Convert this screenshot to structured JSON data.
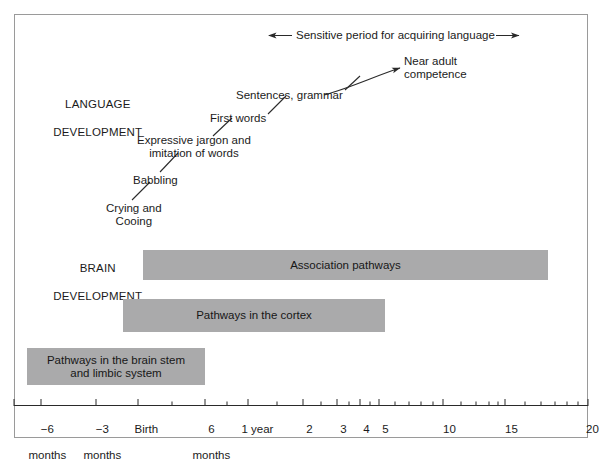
{
  "figure": {
    "sensitive_period": {
      "label": "Sensitive period for acquiring language",
      "left_arrow_icon": "left-arrow-icon",
      "right_arrow_icon": "right-arrow-icon"
    },
    "sections": {
      "language": {
        "heading_line1": "LANGUAGE",
        "heading_line2": "DEVELOPMENT"
      },
      "brain": {
        "heading_line1": "BRAIN",
        "heading_line2": "DEVELOPMENT"
      }
    },
    "language_milestones": [
      {
        "label": "Near adult\ncompetence"
      },
      {
        "label": "Sentences, grammar"
      },
      {
        "label": "First words"
      },
      {
        "label": "Expressive jargon and\nimitation of words"
      },
      {
        "label": "Babbling"
      },
      {
        "label": "Crying and\nCooing"
      }
    ],
    "brain_bars": [
      {
        "label": "Association pathways"
      },
      {
        "label": "Pathways in the cortex"
      },
      {
        "label": "Pathways in the brain stem\nand limbic system"
      }
    ],
    "axis": {
      "ticks": [
        {
          "line1": "−6",
          "line2": "months"
        },
        {
          "line1": "−3",
          "line2": "months"
        },
        {
          "line1": "Birth",
          "line2": ""
        },
        {
          "line1": "6",
          "line2": "months"
        },
        {
          "line1": "1 year",
          "line2": ""
        },
        {
          "line1": "2",
          "line2": ""
        },
        {
          "line1": "3",
          "line2": ""
        },
        {
          "line1": "4",
          "line2": ""
        },
        {
          "line1": "5",
          "line2": ""
        },
        {
          "line1": "10",
          "line2": ""
        },
        {
          "line1": "15",
          "line2": ""
        },
        {
          "line1": "20",
          "line2": ""
        }
      ]
    },
    "colors": {
      "bar_fill": "#aaaaab",
      "frame": "#9a9a9a",
      "text": "#1b1b1b"
    }
  },
  "chart_data": {
    "type": "bar",
    "title": "",
    "xlabel": "Age (log scale: months before birth through 20 years)",
    "ylabel": "",
    "grid": false,
    "legend": "none",
    "axis_scale": "log-after-birth",
    "axis_tick_values": [
      "-6 months",
      "-3 months",
      "Birth",
      "6 months",
      "1 year",
      "2",
      "3",
      "4",
      "5",
      "10",
      "15",
      "20"
    ],
    "axis_tick_pixels": [
      41,
      96,
      138,
      205,
      248,
      303,
      337,
      360,
      379,
      443,
      505,
      588
    ],
    "categories": [
      "Association pathways",
      "Pathways in the cortex",
      "Pathways in the brain stem and limbic system"
    ],
    "series": [
      {
        "name": "Brain development spans",
        "values": [
          {
            "category": "Association pathways",
            "start": "~3 months",
            "end": "~15 years",
            "start_px": 143,
            "end_px": 548
          },
          {
            "category": "Pathways in the cortex",
            "start": "Birth",
            "end": "~4.5 years",
            "start_px": 123,
            "end_px": 385
          },
          {
            "category": "Pathways in the brain stem and limbic system",
            "start": "before -6 months",
            "end": "~6 months",
            "start_px": 27,
            "end_px": 205
          }
        ]
      }
    ],
    "annotations": [
      {
        "text": "Sensitive period for acquiring language",
        "type": "double-arrow",
        "x_start_px": 268,
        "x_end_px": 520
      },
      {
        "text": "Crying and Cooing",
        "approx_age": "~0-2 months"
      },
      {
        "text": "Babbling",
        "approx_age": "~4-6 months"
      },
      {
        "text": "Expressive jargon and imitation of words",
        "approx_age": "~9-12 months"
      },
      {
        "text": "First words",
        "approx_age": "~1 year"
      },
      {
        "text": "Sentences, grammar",
        "approx_age": "~2 years"
      },
      {
        "text": "Near adult competence",
        "approx_age": "~4-5 years"
      }
    ]
  }
}
